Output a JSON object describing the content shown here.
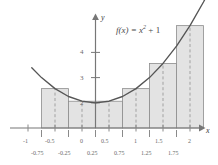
{
  "figure": {
    "function_label": "f(x) = x",
    "function_exponent": "2",
    "function_tail": " + 1",
    "x_axis_name": "x",
    "y_axis_name": "y"
  },
  "axes": {
    "x_ticks_major": [
      "-1",
      "-0.5",
      "0",
      "0.5",
      "1",
      "1.5",
      "2"
    ],
    "x_ticks_minor": [
      "-0.75",
      "-0.25",
      "0.25",
      "0.75",
      "1.25",
      "1.75"
    ],
    "y_ticks": [
      "2",
      "3",
      "4"
    ]
  },
  "colors": {
    "curve": "#555555",
    "bar_fill": "#e3e3e3",
    "bar_stroke": "#8c8c8c",
    "axis": "#777777",
    "midline": "#9a9a9a",
    "text": "#6b6b6b",
    "background": "#ffffff"
  },
  "chart_data": {
    "type": "bar",
    "title": "",
    "subtitle": "",
    "xlabel": "x",
    "ylabel": "y",
    "xlim": [
      -1.25,
      2.25
    ],
    "ylim": [
      0,
      4.6
    ],
    "grid": false,
    "legend": null,
    "annotations": [
      "f(x) = x^2 + 1"
    ],
    "method": "midpoint Riemann sum",
    "interval": [
      -1,
      2
    ],
    "n_subintervals": 6,
    "bar_width": 0.5,
    "categories": [
      "-1 to -0.5",
      "-0.5 to 0",
      "0 to 0.5",
      "0.5 to 1",
      "1 to 1.5",
      "1.5 to 2"
    ],
    "midpoints": [
      -0.75,
      -0.25,
      0.25,
      0.75,
      1.25,
      1.75
    ],
    "values": [
      1.5625,
      1.0625,
      1.0625,
      1.5625,
      2.5625,
      4.0625
    ],
    "bar_edges": [
      -1,
      -0.5,
      0,
      0.5,
      1,
      1.5,
      2
    ],
    "series": [
      {
        "name": "midpoint rectangles",
        "values": [
          1.5625,
          1.0625,
          1.0625,
          1.5625,
          2.5625,
          4.0625
        ]
      },
      {
        "name": "f(x) = x^2 + 1",
        "type": "line",
        "x": [
          -1.18,
          -1.0,
          -0.75,
          -0.5,
          -0.25,
          0,
          0.25,
          0.5,
          0.75,
          1.0,
          1.25,
          1.5,
          1.75,
          2.0,
          2.1
        ],
        "y": [
          2.392,
          2.0,
          1.5625,
          1.25,
          1.0625,
          1.0,
          1.0625,
          1.25,
          1.5625,
          2.0,
          2.5625,
          3.25,
          4.0625,
          5.0,
          5.41
        ]
      }
    ]
  }
}
